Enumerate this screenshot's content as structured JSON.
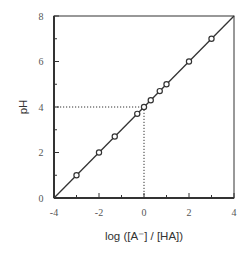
{
  "chart_data": {
    "type": "scatter",
    "title": "",
    "xlabel": "log ([A⁻] / [HA])",
    "ylabel": "pH",
    "xlim": [
      -4,
      4
    ],
    "ylim": [
      0,
      8
    ],
    "x_ticks": [
      -4,
      -2,
      0,
      2,
      4
    ],
    "x_minor_ticks": [
      -3,
      -1,
      1,
      3
    ],
    "y_ticks": [
      0,
      2,
      4,
      6,
      8
    ],
    "y_minor_ticks": [
      1,
      3,
      5,
      7
    ],
    "grid": false,
    "legend": null,
    "series": [
      {
        "name": "data points",
        "marker": "open-circle",
        "x": [
          -3,
          -2,
          -1.3,
          -0.3,
          0,
          0.3,
          0.7,
          1,
          2,
          3
        ],
        "y": [
          1,
          2,
          2.7,
          3.7,
          4,
          4.3,
          4.7,
          5,
          6,
          7
        ]
      },
      {
        "name": "fit line (pH = pKa + log([A⁻]/[HA]))",
        "style": "solid-line",
        "x": [
          -4,
          4
        ],
        "y": [
          0,
          8
        ]
      }
    ],
    "annotations": [
      {
        "type": "dotted-guide",
        "from": [
          -4,
          4
        ],
        "to": [
          0,
          4
        ],
        "note": "pKa = 4 at log ratio 0"
      },
      {
        "type": "dotted-guide",
        "from": [
          0,
          0
        ],
        "to": [
          0,
          4
        ]
      }
    ]
  },
  "colors": {
    "axis": "#333333",
    "line": "#333333",
    "marker": "#333333",
    "tick_text": "#555555"
  }
}
